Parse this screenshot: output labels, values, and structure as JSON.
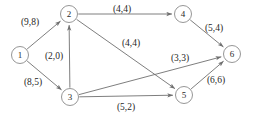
{
  "diagram": {
    "label_format": "(capacity,flow)",
    "colors": {
      "background": "#ffffff",
      "edge": "#6f6f6f",
      "node_stroke": "#8a8a8a",
      "node_fill": "#ffffff",
      "text": "#1f1f1f"
    }
  },
  "chart_data": {
    "type": "diagram",
    "nodes": [
      {
        "id": "1",
        "label": "1",
        "x": 20,
        "y": 55,
        "r": 8.5
      },
      {
        "id": "2",
        "label": "2",
        "x": 69,
        "y": 14,
        "r": 8.5
      },
      {
        "id": "3",
        "label": "3",
        "x": 70,
        "y": 97,
        "r": 8.5
      },
      {
        "id": "4",
        "label": "4",
        "x": 183,
        "y": 14,
        "r": 8.5
      },
      {
        "id": "5",
        "label": "5",
        "x": 184,
        "y": 95,
        "r": 8.5
      },
      {
        "id": "6",
        "label": "6",
        "x": 232,
        "y": 54,
        "r": 8.5
      }
    ],
    "edges": [
      {
        "id": "e-1-2",
        "from": "1",
        "to": "2",
        "capacity": 9,
        "flow": 8,
        "label": "(9,8)",
        "label_x": 30,
        "label_y": 22
      },
      {
        "id": "e-1-3",
        "from": "1",
        "to": "3",
        "capacity": 8,
        "flow": 5,
        "label": "(8,5)",
        "label_x": 33,
        "label_y": 82
      },
      {
        "id": "e-3-2",
        "from": "3",
        "to": "2",
        "capacity": 2,
        "flow": 0,
        "label": "(2,0)",
        "label_x": 54,
        "label_y": 56
      },
      {
        "id": "e-2-4",
        "from": "2",
        "to": "4",
        "capacity": 4,
        "flow": 4,
        "label": "(4,4)",
        "label_x": 122,
        "label_y": 9
      },
      {
        "id": "e-2-5",
        "from": "2",
        "to": "5",
        "capacity": 4,
        "flow": 4,
        "label": "(4,4)",
        "label_x": 131,
        "label_y": 43
      },
      {
        "id": "e-3-6",
        "from": "3",
        "to": "6",
        "capacity": 3,
        "flow": 3,
        "label": "(3,3)",
        "label_x": 180,
        "label_y": 58
      },
      {
        "id": "e-3-5",
        "from": "3",
        "to": "5",
        "capacity": 5,
        "flow": 2,
        "label": "(5,2)",
        "label_x": 126,
        "label_y": 107
      },
      {
        "id": "e-4-6",
        "from": "4",
        "to": "6",
        "capacity": 5,
        "flow": 4,
        "label": "(5,4)",
        "label_x": 214,
        "label_y": 28
      },
      {
        "id": "e-5-6",
        "from": "5",
        "to": "6",
        "capacity": 6,
        "flow": 6,
        "label": "(6,6)",
        "label_x": 216,
        "label_y": 80
      }
    ]
  }
}
